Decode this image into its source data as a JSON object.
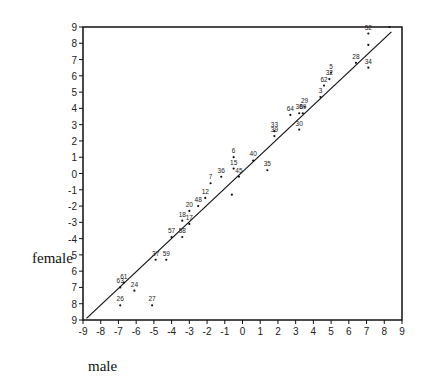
{
  "chart_data": {
    "type": "scatter",
    "title": "",
    "xlabel": "male",
    "ylabel": "female",
    "xlim": [
      -9,
      9
    ],
    "ylim": [
      -9,
      9
    ],
    "xticks": [
      "-9",
      "-8",
      "-7",
      "-6",
      "-5",
      "-4",
      "-3",
      "-2",
      "-1",
      "0",
      "1",
      "2",
      "3",
      "4",
      "5",
      "6",
      "7",
      "8",
      "9"
    ],
    "yticks": [
      "9",
      "8",
      "7",
      "6",
      "5",
      "4",
      "3",
      "2",
      "1",
      "0",
      "-1",
      "-2",
      "-3",
      "-4",
      "5",
      "6",
      "7",
      "8",
      "9"
    ],
    "grid": false,
    "reference_line": {
      "from": [
        -8.8,
        -8.9
      ],
      "to": [
        8.4,
        8.7
      ]
    },
    "points": [
      {
        "label": "52",
        "x": 7.1,
        "y": 8.6
      },
      {
        "label": "",
        "x": 8.3,
        "y": 9.0
      },
      {
        "label": "",
        "x": 7.1,
        "y": 7.9
      },
      {
        "label": "28",
        "x": 6.4,
        "y": 6.8
      },
      {
        "label": "34",
        "x": 7.1,
        "y": 6.5
      },
      {
        "label": "5",
        "x": 5.0,
        "y": 6.2
      },
      {
        "label": "32",
        "x": 4.9,
        "y": 5.8
      },
      {
        "label": "62",
        "x": 4.6,
        "y": 5.4
      },
      {
        "label": "3",
        "x": 4.4,
        "y": 4.7
      },
      {
        "label": "29",
        "x": 3.5,
        "y": 4.1
      },
      {
        "label": "64",
        "x": 2.7,
        "y": 3.6
      },
      {
        "label": "38",
        "x": 3.2,
        "y": 3.7
      },
      {
        "label": "69",
        "x": 3.4,
        "y": 3.7
      },
      {
        "label": "30",
        "x": 3.2,
        "y": 2.7
      },
      {
        "label": "33",
        "x": 1.8,
        "y": 2.6
      },
      {
        "label": "39",
        "x": 1.8,
        "y": 2.3
      },
      {
        "label": "6",
        "x": -0.5,
        "y": 1.0
      },
      {
        "label": "40",
        "x": 0.6,
        "y": 0.8
      },
      {
        "label": "15",
        "x": -0.5,
        "y": 0.3
      },
      {
        "label": "35",
        "x": 1.4,
        "y": 0.2
      },
      {
        "label": "45",
        "x": -0.2,
        "y": -0.2
      },
      {
        "label": "36",
        "x": -1.2,
        "y": -0.2
      },
      {
        "label": "7",
        "x": -1.8,
        "y": -0.6
      },
      {
        "label": "",
        "x": -0.6,
        "y": -1.3
      },
      {
        "label": "12",
        "x": -2.1,
        "y": -1.5
      },
      {
        "label": "48",
        "x": -2.5,
        "y": -2.0
      },
      {
        "label": "20",
        "x": -3.0,
        "y": -2.3
      },
      {
        "label": "18",
        "x": -3.4,
        "y": -2.9
      },
      {
        "label": "17",
        "x": -3.0,
        "y": -3.1
      },
      {
        "label": "57",
        "x": -4.0,
        "y": -3.9
      },
      {
        "label": "58",
        "x": -3.4,
        "y": -3.9
      },
      {
        "label": "37",
        "x": -4.9,
        "y": -5.3
      },
      {
        "label": "59",
        "x": -4.3,
        "y": -5.3
      },
      {
        "label": "61",
        "x": -6.7,
        "y": -6.7
      },
      {
        "label": "63",
        "x": -6.9,
        "y": -7.0
      },
      {
        "label": "24",
        "x": -6.1,
        "y": -7.2
      },
      {
        "label": "26",
        "x": -6.9,
        "y": -8.1
      },
      {
        "label": "27",
        "x": -5.1,
        "y": -8.1
      }
    ]
  },
  "labels": {
    "x": "male",
    "y": "female"
  }
}
